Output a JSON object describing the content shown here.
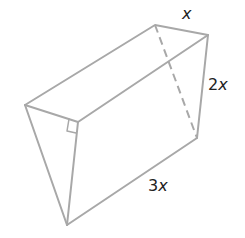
{
  "diagram": {
    "type": "triangular-prism",
    "stroke_color": "#a8a8a8",
    "label_color": "#222222",
    "labels": {
      "top_edge": {
        "coef": "",
        "var": "x"
      },
      "right_edge": {
        "coef": "2",
        "var": "x"
      },
      "bottom_edge": {
        "coef": "3",
        "var": "x"
      }
    },
    "right_angle_marker": true
  }
}
